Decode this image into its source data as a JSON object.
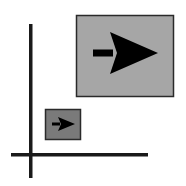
{
  "icon": {
    "name": "scale-up-icon",
    "colors": {
      "background": "#ffffff",
      "axis": "#1a1a1a",
      "large_box_fill": "#a6a6a6",
      "small_box_fill": "#7a7a7a",
      "box_border": "#2a2a2a",
      "arrow": "#000000"
    }
  }
}
